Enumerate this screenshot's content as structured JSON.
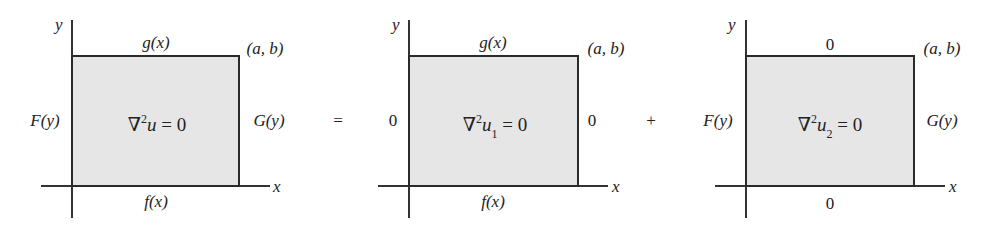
{
  "figure": {
    "operators": {
      "equals": "=",
      "plus": "+"
    },
    "panels": [
      {
        "axis_y": "y",
        "axis_x": "x",
        "top": "g(x)",
        "bottom": "f(x)",
        "left": "F(y)",
        "right": "G(y)",
        "corner": "(a, b)",
        "eq_pre": "∇",
        "eq_sup": "2",
        "eq_var": "u",
        "eq_sub": "",
        "eq_post": " = 0"
      },
      {
        "axis_y": "y",
        "axis_x": "x",
        "top": "g(x)",
        "bottom": "f(x)",
        "left": "0",
        "right": "0",
        "corner": "(a, b)",
        "eq_pre": "∇",
        "eq_sup": "2",
        "eq_var": "u",
        "eq_sub": "1",
        "eq_post": " = 0"
      },
      {
        "axis_y": "y",
        "axis_x": "x",
        "top": "0",
        "bottom": "0",
        "left": "F(y)",
        "right": "G(y)",
        "corner": "(a, b)",
        "eq_pre": "∇",
        "eq_sup": "2",
        "eq_var": "u",
        "eq_sub": "2",
        "eq_post": " = 0"
      }
    ],
    "colors": {
      "fill": "#e6e6e6",
      "stroke": "#2a2a2a"
    }
  }
}
